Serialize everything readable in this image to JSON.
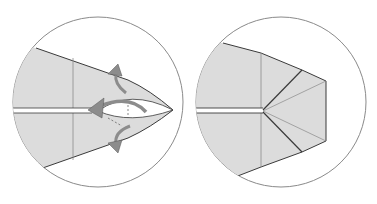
{
  "diagram": {
    "colors": {
      "paper": "#dcdcdc",
      "circle_border": "#8a8a8a",
      "edge": "#3a3a3a",
      "crease": "#7a7a7a",
      "arrow": "#8c8c8c",
      "background": "#ffffff"
    },
    "steps": [
      {
        "id": "step-1",
        "description": "Tip with swivel folds; arrows indicate pulling layers outward",
        "arrows": [
          "arrow-up-swing",
          "arrow-left-pull",
          "arrow-down-swing"
        ]
      },
      {
        "id": "step-2",
        "description": "Result: tip squashed into flattened pentagon shape"
      }
    ]
  }
}
